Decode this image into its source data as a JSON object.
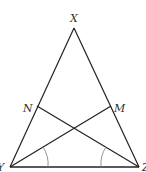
{
  "diagram": {
    "type": "triangle",
    "stroke_color": "#222222",
    "arc_color": "#888888",
    "vertices": {
      "X": {
        "label": "X",
        "x": 74,
        "y": 28
      },
      "Y": {
        "label": "Y",
        "x": 10,
        "y": 167
      },
      "Z": {
        "label": "Z",
        "x": 139,
        "y": 167
      },
      "N": {
        "label": "N",
        "x": 37,
        "y": 106
      },
      "M": {
        "label": "M",
        "x": 111,
        "y": 106
      }
    },
    "segments": [
      "XY",
      "XZ",
      "YZ",
      "YM",
      "ZN"
    ],
    "angle_marks": [
      "angle at Y",
      "angle at Z"
    ]
  }
}
